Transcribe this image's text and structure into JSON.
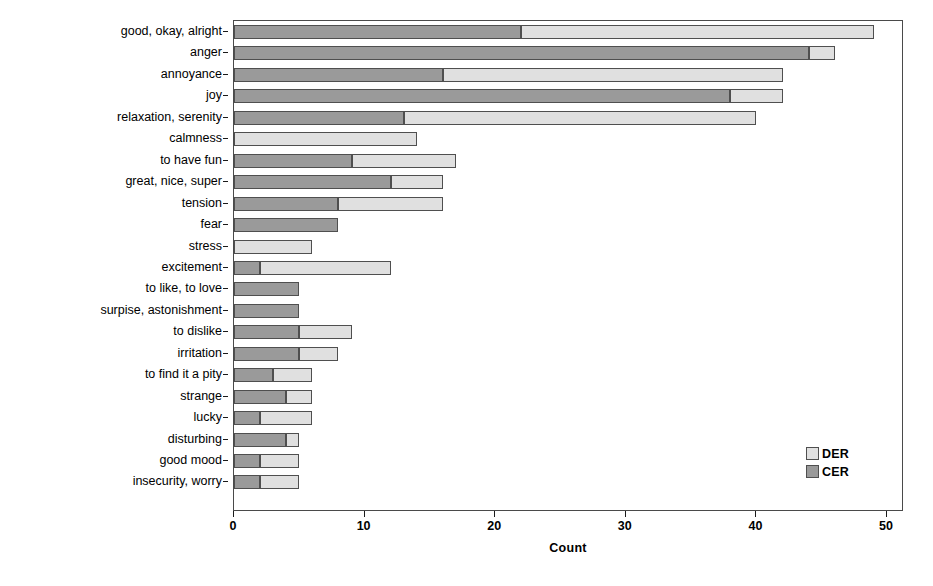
{
  "chart_data": {
    "type": "bar",
    "orientation": "horizontal",
    "stacked": true,
    "title": "",
    "xlabel": "Count",
    "ylabel": "Free Response Categories",
    "xlim": [
      0,
      50
    ],
    "xticks": [
      0,
      10,
      20,
      30,
      40,
      50
    ],
    "grid": false,
    "legend_position": "bottom-right",
    "categories": [
      "good, okay, alright",
      "anger",
      "annoyance",
      "joy",
      "relaxation, serenity",
      "calmness",
      "to have fun",
      "great, nice, super",
      "tension",
      "fear",
      "stress",
      "excitement",
      "to like, to love",
      "surpise, astonishment",
      "to dislike",
      "irritation",
      "to find it a pity",
      "strange",
      "lucky",
      "disturbing",
      "good mood",
      "insecurity, worry"
    ],
    "series": [
      {
        "name": "CER",
        "color": "#9a9a9a",
        "values": [
          22,
          44,
          16,
          38,
          13,
          0,
          9,
          12,
          8,
          8,
          0,
          2,
          5,
          5,
          5,
          5,
          3,
          4,
          2,
          4,
          2,
          2
        ]
      },
      {
        "name": "DER",
        "color": "#e0e0e0",
        "values": [
          27,
          2,
          26,
          4,
          27,
          14,
          8,
          4,
          8,
          0,
          6,
          10,
          0,
          0,
          4,
          3,
          3,
          2,
          4,
          1,
          3,
          3
        ]
      }
    ],
    "totals": [
      49,
      46,
      42,
      42,
      40,
      14,
      17,
      16,
      16,
      8,
      6,
      12,
      5,
      5,
      9,
      8,
      6,
      6,
      6,
      5,
      5,
      5
    ]
  },
  "legend": {
    "entries": [
      {
        "label": "DER",
        "color": "#e0e0e0"
      },
      {
        "label": "CER",
        "color": "#9a9a9a"
      }
    ]
  }
}
